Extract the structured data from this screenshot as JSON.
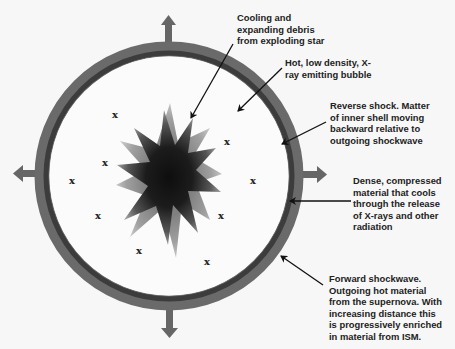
{
  "diagram": {
    "colors": {
      "background": "#f7f7f7",
      "ring_outer": "#6a6a6a",
      "ring_inner": "#3f3f3f",
      "arrow_out": "#666666",
      "star_core": "#111111",
      "star_edge": "#8a8a8a",
      "text": "#222222"
    },
    "annotations": [
      {
        "id": "debris",
        "text": "Cooling and expanding debris from exploding star"
      },
      {
        "id": "bubble",
        "text": "Hot, low density, X-ray emitting bubble"
      },
      {
        "id": "reverse-shock",
        "text": "Reverse shock. Matter of inner shell moving backward relative to outgoing shockwave"
      },
      {
        "id": "dense-material",
        "text": "Dense, compressed material that cools through the release of X-rays and other radiation"
      },
      {
        "id": "forward-shock",
        "text": "Forward shockwave. Outgoing hot material from the supernova. With increasing distance this is progressively enriched in material from ISM."
      }
    ],
    "x_marks": {
      "symbol": "x",
      "count": 9
    }
  }
}
